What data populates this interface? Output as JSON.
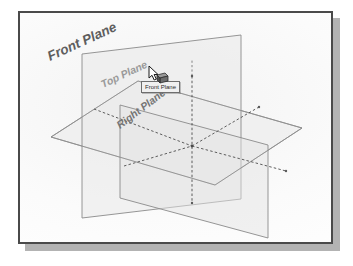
{
  "window": {
    "title": "CAD 3D Viewport",
    "border_color": "#4a4a4a",
    "shadow_color": "#b3b3b3",
    "background_color": "#fbfbfb"
  },
  "scene": {
    "description": "Isometric view of three orthogonal CAD reference planes intersecting at the origin",
    "plane_edge_color": "#8c8c8c",
    "plane_fill_color": "#ededed",
    "hidden_line_color": "#555555",
    "labels": [
      {
        "name": "front-plane-label",
        "text": "Front Plane",
        "x": 30,
        "y": 48,
        "rotation": -25,
        "font_size": 13,
        "color": "#5a5a5a",
        "style": "bold-italic"
      },
      {
        "name": "top-plane-label",
        "text": "Top Plane",
        "x": 82,
        "y": 72,
        "rotation": -25,
        "font_size": 10,
        "color": "#8f8f8f",
        "style": "bold-italic"
      },
      {
        "name": "right-plane-label",
        "text": "Right Plane",
        "x": 100,
        "y": 110,
        "rotation": -37,
        "font_size": 10,
        "color": "#6f6f6f",
        "style": "bold-italic"
      }
    ],
    "planes": [
      {
        "name": "top-plane",
        "label": "Top Plane",
        "orientation": "horizontal",
        "points": "31,124 118,68 282,115 195,172"
      },
      {
        "name": "front-plane",
        "label": "Front Plane",
        "orientation": "vertical-receding",
        "points": "62,41 221,22 221,186 62,205"
      },
      {
        "name": "right-plane",
        "label": "Right Plane",
        "orientation": "vertical-facing",
        "points": "100,92 248,132 248,225 100,185"
      }
    ],
    "origin": {
      "x": 172,
      "y": 133
    }
  },
  "tooltip": {
    "name": "front-plane-tooltip",
    "text": "Front Plane",
    "background_color": "#f0f0f0",
    "border_color": "#6e6e6e",
    "text_color": "#2b2b2b"
  },
  "cursor": {
    "name": "plane-select-cursor",
    "type": "arrow-with-plane-icon",
    "x": 128,
    "y": 53,
    "hover_target": "Front Plane"
  }
}
